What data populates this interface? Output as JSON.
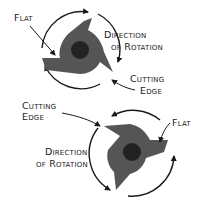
{
  "diagram": {
    "colors": {
      "cutter": "#555555",
      "hub": "#222222",
      "ink": "#1a1a1a",
      "background": "#ffffff"
    },
    "top_cutter": {
      "labels": {
        "flat": "Flat",
        "direction_line1": "Direction",
        "direction_line2": "of Rotation",
        "cutting_line1": "Cutting",
        "cutting_line2": "Edge"
      },
      "rotation": "clockwise"
    },
    "bottom_cutter": {
      "labels": {
        "flat": "Flat",
        "direction_line1": "Direction",
        "direction_line2": "of Rotation",
        "cutting_line1": "Cutting",
        "cutting_line2": "Edge"
      },
      "rotation": "counterclockwise"
    }
  }
}
